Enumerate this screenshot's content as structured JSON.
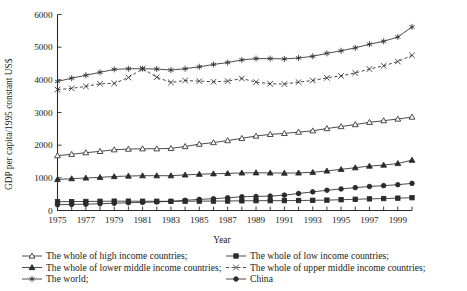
{
  "chart_data": {
    "type": "line",
    "title": "",
    "xlabel": "Year",
    "ylabel": "GDP per capita/1995 constant US$",
    "xlim": [
      1975,
      2000
    ],
    "ylim": [
      0,
      6000
    ],
    "ytick_step": 1000,
    "yticks": [
      "0",
      "1000",
      "2000",
      "3000",
      "4000",
      "5000",
      "6000"
    ],
    "xticks": [
      "1975",
      "1977",
      "1979",
      "1981",
      "1983",
      "1985",
      "1987",
      "1989",
      "1991",
      "1993",
      "1995",
      "1997",
      "1999"
    ],
    "x": [
      1975,
      1976,
      1977,
      1978,
      1979,
      1980,
      1981,
      1982,
      1983,
      1984,
      1985,
      1986,
      1987,
      1988,
      1989,
      1990,
      1991,
      1992,
      1993,
      1994,
      1995,
      1996,
      1997,
      1998,
      1999,
      2000
    ],
    "grid": false,
    "legend_position": "below",
    "series": [
      {
        "name": "The whole of high income countries;",
        "marker": "open-triangle",
        "line": "solid",
        "values": [
          1680,
          1720,
          1770,
          1810,
          1860,
          1880,
          1890,
          1890,
          1900,
          1960,
          2030,
          2080,
          2140,
          2210,
          2280,
          2330,
          2360,
          2400,
          2440,
          2510,
          2570,
          2630,
          2700,
          2750,
          2800,
          2860
        ]
      },
      {
        "name": "The whole of low income countries;",
        "marker": "filled-square",
        "line": "solid",
        "values": [
          268,
          272,
          276,
          282,
          286,
          286,
          284,
          282,
          280,
          284,
          286,
          288,
          290,
          296,
          300,
          300,
          302,
          306,
          312,
          318,
          330,
          344,
          356,
          366,
          378,
          392
        ]
      },
      {
        "name": "The whole of lower middle income countries;",
        "marker": "filled-triangle",
        "line": "solid",
        "values": [
          950,
          975,
          995,
          1015,
          1040,
          1055,
          1065,
          1065,
          1065,
          1090,
          1110,
          1125,
          1135,
          1150,
          1155,
          1150,
          1145,
          1150,
          1170,
          1210,
          1260,
          1310,
          1360,
          1390,
          1440,
          1540
        ]
      },
      {
        "name": "The whole of upper middle income countries;",
        "marker": "cross-x",
        "line": "dashed",
        "values": [
          3700,
          3740,
          3800,
          3880,
          3890,
          4070,
          4340,
          4080,
          3920,
          3980,
          3960,
          3940,
          3960,
          4040,
          3930,
          3880,
          3870,
          3930,
          3980,
          4060,
          4120,
          4210,
          4330,
          4430,
          4560,
          4750
        ]
      },
      {
        "name": "The world;",
        "marker": "asterisk",
        "line": "solid",
        "values": [
          3950,
          4050,
          4140,
          4230,
          4320,
          4340,
          4340,
          4330,
          4300,
          4340,
          4400,
          4470,
          4530,
          4610,
          4650,
          4650,
          4640,
          4670,
          4720,
          4810,
          4890,
          4980,
          5090,
          5180,
          5310,
          5620
        ]
      },
      {
        "name": "China",
        "marker": "filled-circle",
        "line": "solid",
        "values": [
          178,
          186,
          192,
          208,
          222,
          238,
          248,
          262,
          282,
          312,
          340,
          360,
          390,
          420,
          430,
          440,
          470,
          520,
          570,
          620,
          660,
          700,
          735,
          760,
          790,
          830
        ]
      }
    ]
  },
  "legend": {
    "entries": [
      {
        "label": "The whole of high income countries;",
        "marker": "open-triangle",
        "line": "solid"
      },
      {
        "label": "The whole of low income countries;",
        "marker": "filled-square",
        "line": "solid"
      },
      {
        "label": "The whole of lower middle income countries;",
        "marker": "filled-triangle",
        "line": "solid"
      },
      {
        "label": "The whole of upper middle income countries;",
        "marker": "cross-x",
        "line": "dashed"
      },
      {
        "label": "The world;",
        "marker": "asterisk",
        "line": "solid"
      },
      {
        "label": "China",
        "marker": "filled-circle",
        "line": "solid"
      }
    ]
  }
}
